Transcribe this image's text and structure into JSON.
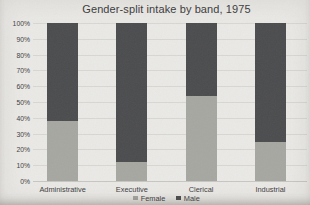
{
  "chart_data": {
    "type": "bar",
    "variant": "stacked-100-percent",
    "title": "Gender-split intake by band, 1975",
    "categories": [
      "Administrative",
      "Executive",
      "Clerical",
      "Industrial"
    ],
    "series": [
      {
        "name": "Female",
        "color": "#a6a7a1",
        "values": [
          38,
          12,
          54,
          25
        ]
      },
      {
        "name": "Male",
        "color": "#4b4c4e",
        "values": [
          62,
          88,
          46,
          75
        ]
      }
    ],
    "unit": "%",
    "ylim": [
      0,
      100
    ],
    "y_ticks": [
      "0%",
      "10%",
      "20%",
      "30%",
      "40%",
      "50%",
      "60%",
      "70%",
      "80%",
      "90%",
      "100%"
    ],
    "grid": true,
    "legend_position": "bottom"
  },
  "colors": {
    "background": "#eae9e6",
    "gridline": "#d8d7d3",
    "text": "#3c3c3e"
  }
}
